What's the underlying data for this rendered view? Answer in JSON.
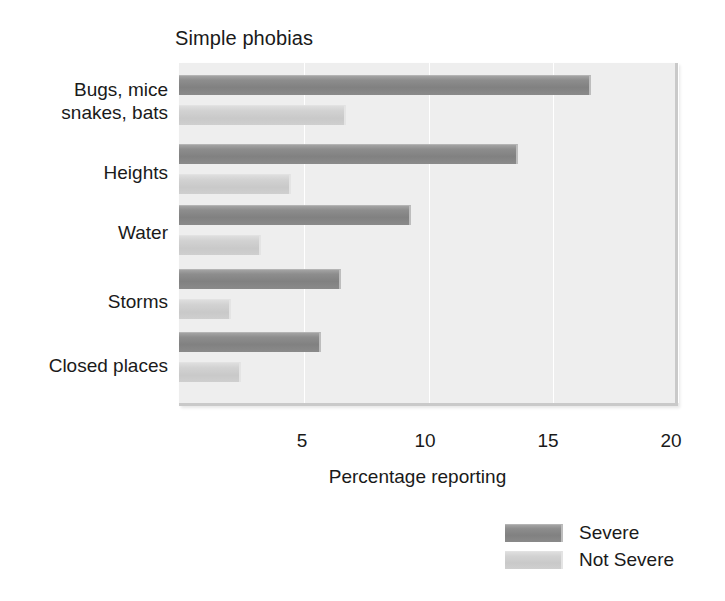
{
  "chart_data": {
    "type": "bar",
    "orientation": "horizontal",
    "title": "Simple phobias",
    "xlabel": "Percentage reporting",
    "ylabel": "",
    "categories": [
      "Bugs, mice\nsnakes, bats",
      "Heights",
      "Water",
      "Storms",
      "Closed places"
    ],
    "series": [
      {
        "name": "Severe",
        "color": "#8d8d8d",
        "values": [
          16.5,
          13.6,
          9.3,
          6.5,
          5.7
        ]
      },
      {
        "name": "Not Severe",
        "color": "#d0d0d0",
        "values": [
          6.7,
          4.5,
          3.3,
          2.1,
          2.5
        ]
      }
    ],
    "xlim": [
      0,
      20
    ],
    "xticks": [
      5,
      10,
      15,
      20
    ],
    "xticklabels": [
      "5",
      "10",
      "15",
      "20"
    ],
    "grid": "vertical",
    "legend_position": "bottom-right",
    "plot_background": "#eeeeee"
  },
  "legend": {
    "entries": [
      {
        "label": "Severe"
      },
      {
        "label": "Not Severe"
      }
    ]
  }
}
